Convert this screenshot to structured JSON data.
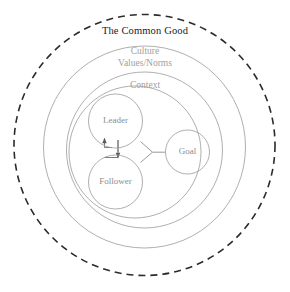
{
  "diagram": {
    "title": "The Common Good",
    "rings": [
      {
        "id": "common-good",
        "label": "The Common Good",
        "style": "dashed",
        "color": "#2b2b2b"
      },
      {
        "id": "culture",
        "label": "Culture",
        "style": "solid",
        "color": "#9a9a9a"
      },
      {
        "id": "values-norms",
        "label": "Values/Norms",
        "style": "none",
        "color": "#9a9a9a"
      },
      {
        "id": "context",
        "label": "Context",
        "style": "solid",
        "color": "#9a9a9a"
      }
    ],
    "nodes": [
      {
        "id": "leader",
        "label": "Leader"
      },
      {
        "id": "follower",
        "label": "Follower"
      },
      {
        "id": "goal",
        "label": "Goal"
      }
    ],
    "connections": [
      {
        "from": "leader",
        "to": "follower",
        "type": "arrow-down"
      },
      {
        "from": "follower",
        "to": "leader",
        "type": "arrow-up"
      },
      {
        "from": "leader",
        "to": "goal",
        "type": "line"
      },
      {
        "from": "follower",
        "to": "goal",
        "type": "line"
      }
    ]
  }
}
